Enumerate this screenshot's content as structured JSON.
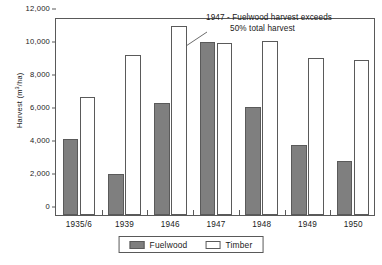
{
  "chart_data": {
    "type": "bar",
    "title": "",
    "xlabel": "",
    "ylabel": "Harvest (m3/ha)",
    "ylabel_prefix": "Harvest (m",
    "ylabel_sup": "3",
    "ylabel_suffix": "/ha)",
    "categories": [
      "1935/6",
      "1939",
      "1946",
      "1947",
      "1948",
      "1949",
      "1950"
    ],
    "series": [
      {
        "name": "Fuelwood",
        "color": "#7f7f7f",
        "values": [
          4600,
          2500,
          6800,
          10500,
          6550,
          4250,
          3250
        ]
      },
      {
        "name": "Timber",
        "color": "#ffffff",
        "values": [
          7150,
          9700,
          11450,
          10450,
          10550,
          9500,
          9400
        ]
      }
    ],
    "ylim": [
      0,
      12000
    ],
    "yticks": [
      0,
      2000,
      4000,
      6000,
      8000,
      10000,
      12000
    ],
    "ytick_labels": [
      "0",
      "2,000",
      "4,000",
      "6,000",
      "8,000",
      "10,000",
      "12,000"
    ],
    "grid": false,
    "legend_position": "bottom"
  },
  "annotation": {
    "line1": "1947 - Fuelwood harvest exceeds",
    "line2": "50% total harvest"
  },
  "legend": {
    "items": [
      {
        "label": "Fuelwood"
      },
      {
        "label": "Timber"
      }
    ]
  },
  "caption": {
    "text": ""
  }
}
